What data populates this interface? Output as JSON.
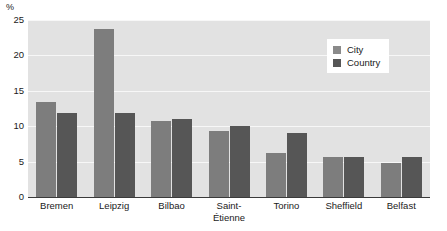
{
  "chart_data": {
    "type": "bar",
    "title": "",
    "subtitle": "",
    "xlabel": "",
    "ylabel": "",
    "unit_label": "%",
    "categories": [
      "Bremen",
      "Leipzig",
      "Bilbao",
      "Saint-Étienne",
      "Torino",
      "Sheffield",
      "Belfast"
    ],
    "category_lines": [
      [
        "Bremen"
      ],
      [
        "Leipzig"
      ],
      [
        "Bilbao"
      ],
      [
        "Saint-",
        "Étienne"
      ],
      [
        "Torino"
      ],
      [
        "Sheffield"
      ],
      [
        "Belfast"
      ]
    ],
    "series": [
      {
        "name": "City",
        "color": "#7d7d7d",
        "values": [
          13.4,
          23.8,
          10.8,
          9.3,
          6.2,
          5.7,
          4.8
        ]
      },
      {
        "name": "Country",
        "color": "#565656",
        "values": [
          11.8,
          11.8,
          11.0,
          10.0,
          9.0,
          5.7,
          5.7
        ]
      }
    ],
    "ylim": [
      0,
      25
    ],
    "yticks": [
      0,
      5,
      10,
      15,
      20,
      25
    ],
    "ytick_labels": [
      "0",
      "5",
      "10",
      "15",
      "20",
      "25"
    ],
    "grid": true,
    "grid_axis": "y",
    "legend_position": "upper right",
    "plot_background": "#e2e2e2",
    "grid_color": "#f7f7f7",
    "axis_color": "#3a3a3a"
  },
  "legend": {
    "entries": [
      {
        "label": "City"
      },
      {
        "label": "Country"
      }
    ]
  }
}
